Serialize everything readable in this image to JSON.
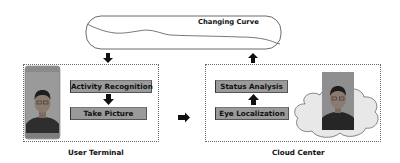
{
  "top_panel": {
    "title": "Changing Curve"
  },
  "left_region": {
    "label": "User Terminal",
    "steps": [
      {
        "label": "Activity Recognition"
      },
      {
        "label": "Take Picture"
      }
    ],
    "image": "phone-selfie-photo"
  },
  "right_region": {
    "label": "Cloud Center",
    "steps": [
      {
        "label": "Status Analysis"
      },
      {
        "label": "Eye Localization"
      }
    ],
    "image": "face-photo-on-cloud"
  },
  "arrows": [
    {
      "from": "Changing Curve",
      "to": "User Terminal",
      "direction": "down"
    },
    {
      "from": "Activity Recognition",
      "to": "Take Picture",
      "direction": "down"
    },
    {
      "from": "User Terminal",
      "to": "Cloud Center",
      "direction": "right"
    },
    {
      "from": "Eye Localization",
      "to": "Status Analysis",
      "direction": "up"
    },
    {
      "from": "Cloud Center",
      "to": "Changing Curve",
      "direction": "up"
    }
  ],
  "colors": {
    "step_fill": "#9a9a9a",
    "arrow": "#111111",
    "cloud_fill": "#e6e6e6",
    "photo_bg": "#8c8c8c"
  }
}
